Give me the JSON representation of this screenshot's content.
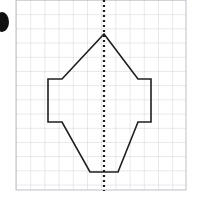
{
  "figure": {
    "background_color": "#ffffff",
    "width": 201,
    "height": 197
  },
  "bullet_marker": {
    "name": "list-bullet-circle",
    "shape": "filled-circle-clipped-at-left-edge",
    "color": "#111111",
    "cx": 2,
    "cy": 22,
    "rx": 7,
    "ry": 10
  },
  "grid": {
    "origin_x": 16,
    "origin_y": 0,
    "cell_size": 14.2,
    "columns": 12,
    "rows": 13.4,
    "width": 170,
    "height": 190,
    "line_color": "#c9c9cf",
    "line_width": 0.8,
    "border_color": "#b9b9c2"
  },
  "symmetry_axis": {
    "name": "vertical-line-of-symmetry",
    "orientation": "vertical",
    "x": 104,
    "y_start": 0,
    "y_end": 191,
    "color": "#1a1a1a",
    "style": "dotted",
    "dash_pattern": "2 3",
    "line_width": 2.2
  },
  "polygon": {
    "name": "symmetric-hexagonal-arrow-shape",
    "stroke_color": "#1f1f1f",
    "stroke_width": 1.6,
    "fill": "none",
    "vertex_count": 10,
    "vertices": [
      {
        "label": "apex",
        "x": 104,
        "y": 34
      },
      {
        "label": "upper-right-diagonal-end",
        "x": 138,
        "y": 79
      },
      {
        "label": "right-shoulder-outer",
        "x": 151,
        "y": 79
      },
      {
        "label": "right-base-outer",
        "x": 151,
        "y": 122
      },
      {
        "label": "right-shoulder-inner-lower",
        "x": 138,
        "y": 122
      },
      {
        "label": "lower-right-diagonal-end",
        "x": 118,
        "y": 172
      },
      {
        "label": "bottom-left",
        "x": 90,
        "y": 172
      },
      {
        "label": "left-shoulder-inner-lower",
        "x": 62,
        "y": 122
      },
      {
        "label": "left-base-outer",
        "x": 48,
        "y": 122
      },
      {
        "label": "left-shoulder-outer",
        "x": 48,
        "y": 79
      },
      {
        "label": "upper-left-diagonal-end",
        "x": 62,
        "y": 79
      }
    ],
    "path": "M 104 34 L 138 79 L 151 79 L 151 122 L 138 122 L 118 172 L 90 172 L 62 122 L 48 122 L 48 79 L 62 79 Z"
  }
}
